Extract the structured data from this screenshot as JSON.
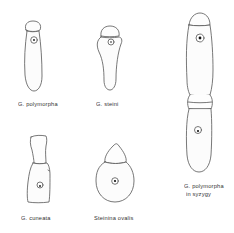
{
  "figure": {
    "specimens": [
      {
        "id": "g-polymorpha",
        "label": "G. polymorpha"
      },
      {
        "id": "g-steini",
        "label": "G. steini"
      },
      {
        "id": "g-cuneata",
        "label": "G. cuneata"
      },
      {
        "id": "steinina-ovalis",
        "label": "Steinina ovalis"
      },
      {
        "id": "g-polymorpha-syzygy",
        "label_line1": "G. polymorpha",
        "label_line2": "in syzygy"
      }
    ],
    "colors": {
      "line": "#555555",
      "nucleus": "#111111",
      "background": "#ffffff"
    }
  }
}
